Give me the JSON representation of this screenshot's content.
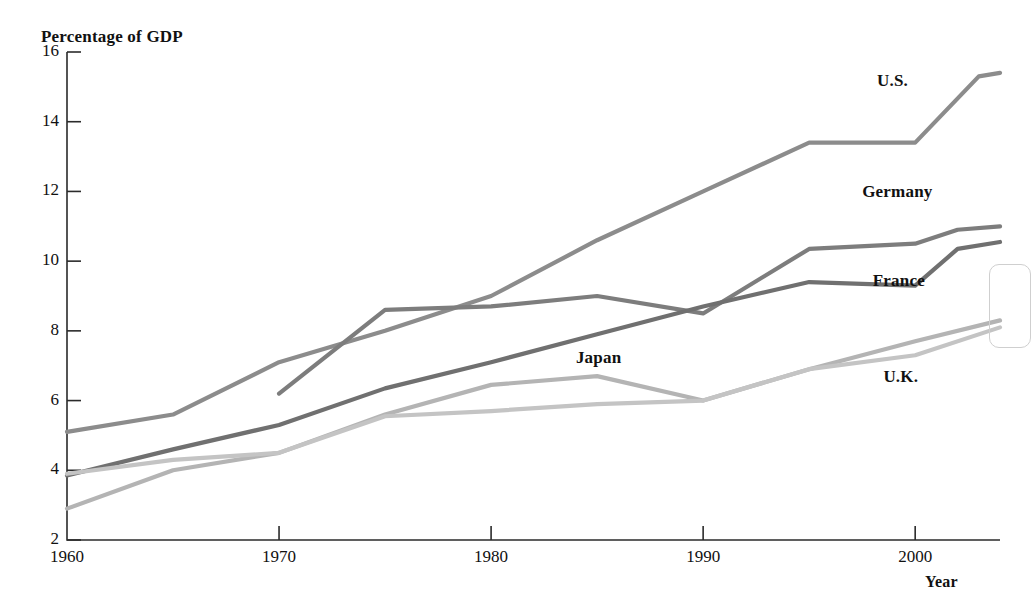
{
  "chart_data": {
    "type": "line",
    "title": "Percentage of GDP",
    "xlabel": "Year",
    "ylabel": "Percentage of GDP",
    "xlim": [
      1960,
      2004
    ],
    "ylim": [
      2,
      16
    ],
    "xticks": [
      1960,
      1970,
      1980,
      1990,
      2000
    ],
    "yticks": [
      2,
      4,
      6,
      8,
      10,
      12,
      14,
      16
    ],
    "grid": false,
    "legend_position": "inline-labels",
    "series": [
      {
        "name": "U.S.",
        "color": "#8c8c8c",
        "label_x": 1998.2,
        "label_y": 15.15,
        "x": [
          1960,
          1965,
          1970,
          1975,
          1980,
          1985,
          1990,
          1995,
          2000,
          2003,
          2004
        ],
        "values": [
          5.1,
          5.6,
          7.1,
          8.0,
          9.0,
          10.6,
          12.0,
          13.4,
          13.4,
          15.3,
          15.4
        ]
      },
      {
        "name": "Germany",
        "color": "#7d7d7d",
        "label_x": 1997.5,
        "label_y": 11.95,
        "x": [
          1970,
          1975,
          1980,
          1985,
          1990,
          1995,
          2000,
          2002,
          2004
        ],
        "values": [
          6.2,
          8.6,
          8.7,
          9.0,
          8.5,
          10.35,
          10.5,
          10.9,
          11.0
        ]
      },
      {
        "name": "France",
        "color": "#707070",
        "label_x": 1998.0,
        "label_y": 9.4,
        "x": [
          1960,
          1965,
          1970,
          1975,
          1980,
          1985,
          1990,
          1995,
          2000,
          2002,
          2004
        ],
        "values": [
          3.85,
          4.6,
          5.3,
          6.35,
          7.1,
          7.9,
          8.7,
          9.4,
          9.3,
          10.35,
          10.55
        ]
      },
      {
        "name": "Japan",
        "color": "#b4b4b4",
        "label_x": 1984.0,
        "label_y": 7.2,
        "x": [
          1960,
          1965,
          1970,
          1975,
          1980,
          1985,
          1990,
          1995,
          2000,
          2004
        ],
        "values": [
          2.9,
          4.0,
          4.5,
          5.6,
          6.45,
          6.7,
          6.0,
          6.9,
          7.7,
          8.3
        ]
      },
      {
        "name": "U.K.",
        "color": "#c4c4c4",
        "label_x": 1998.5,
        "label_y": 6.65,
        "x": [
          1960,
          1965,
          1970,
          1975,
          1980,
          1985,
          1990,
          1995,
          2000,
          2004
        ],
        "values": [
          3.9,
          4.3,
          4.5,
          5.55,
          5.7,
          5.9,
          6.0,
          6.9,
          7.3,
          8.1
        ]
      }
    ]
  },
  "axes": {
    "y_tick_labels": [
      "16",
      "14",
      "12",
      "10",
      "8",
      "6",
      "4",
      "2"
    ],
    "x_tick_labels": [
      "1960",
      "1970",
      "1980",
      "1990",
      "2000"
    ],
    "x_axis_title": "Year",
    "y_axis_title": "Percentage of GDP"
  },
  "series_labels": {
    "us": "U.S.",
    "germany": "Germany",
    "france": "France",
    "japan": "Japan",
    "uk": "U.K."
  },
  "colors": {
    "axis": "#2b2b2b",
    "text": "#111111",
    "us": "#8c8c8c",
    "germany": "#7d7d7d",
    "france": "#707070",
    "japan": "#b4b4b4",
    "uk": "#c4c4c4"
  }
}
